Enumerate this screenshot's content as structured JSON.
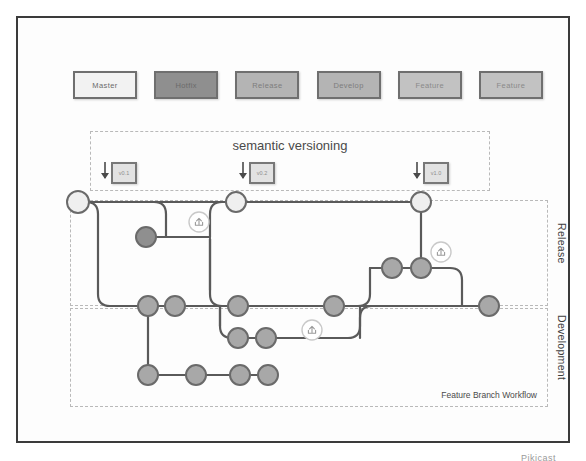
{
  "frame": {
    "watermark": "Pikicast"
  },
  "legend": {
    "items": [
      {
        "label": "Master",
        "fill": "#f2f2f2"
      },
      {
        "label": "Hotfix",
        "fill": "#8f8f8f"
      },
      {
        "label": "Release",
        "fill": "#b4b4b4"
      },
      {
        "label": "Develop",
        "fill": "#b4b4b4"
      },
      {
        "label": "Feature",
        "fill": "#c2c2c2"
      },
      {
        "label": "Feature",
        "fill": "#c2c2c2"
      }
    ]
  },
  "semver": {
    "title": "semantic versioning",
    "tags": [
      {
        "label": "v0.1"
      },
      {
        "label": "v0.2"
      },
      {
        "label": "v1.0"
      }
    ]
  },
  "lanes": {
    "release_label": "Release",
    "development_label": "Development",
    "workflow_caption": "Feature Branch Workflow"
  },
  "colors": {
    "master_node": "#efefef",
    "hotfix_node": "#8f8f8f",
    "commit_node": "#a8a8a8",
    "edge": "#5a5a5a",
    "node_stroke": "#6a6a6a",
    "merge_icon_stroke": "#c9c9c9",
    "dashed_border": "#b9b9b9",
    "frame_border": "#3b3b3b"
  },
  "graph": {
    "nodes": [
      {
        "id": "m1",
        "x": 78,
        "y": 202,
        "r": 11,
        "type": "master"
      },
      {
        "id": "m2",
        "x": 236,
        "y": 202,
        "r": 10,
        "type": "master"
      },
      {
        "id": "m3",
        "x": 421,
        "y": 202,
        "r": 10,
        "type": "master"
      },
      {
        "id": "h1",
        "x": 146,
        "y": 237,
        "r": 10,
        "type": "hotfix"
      },
      {
        "id": "r1",
        "x": 392,
        "y": 268,
        "r": 10,
        "type": "commit"
      },
      {
        "id": "r2",
        "x": 421,
        "y": 268,
        "r": 10,
        "type": "commit"
      },
      {
        "id": "d1",
        "x": 148,
        "y": 306,
        "r": 10,
        "type": "commit"
      },
      {
        "id": "d2",
        "x": 175,
        "y": 306,
        "r": 10,
        "type": "commit"
      },
      {
        "id": "d3",
        "x": 238,
        "y": 306,
        "r": 10,
        "type": "commit"
      },
      {
        "id": "d4",
        "x": 334,
        "y": 306,
        "r": 10,
        "type": "commit"
      },
      {
        "id": "d5",
        "x": 489,
        "y": 306,
        "r": 10,
        "type": "commit"
      },
      {
        "id": "f1",
        "x": 238,
        "y": 338,
        "r": 10,
        "type": "commit"
      },
      {
        "id": "f2",
        "x": 266,
        "y": 338,
        "r": 10,
        "type": "commit"
      },
      {
        "id": "g1",
        "x": 148,
        "y": 375,
        "r": 10,
        "type": "commit"
      },
      {
        "id": "g2",
        "x": 196,
        "y": 375,
        "r": 10,
        "type": "commit"
      },
      {
        "id": "g3",
        "x": 240,
        "y": 375,
        "r": 10,
        "type": "commit"
      },
      {
        "id": "g4",
        "x": 268,
        "y": 375,
        "r": 10,
        "type": "commit"
      }
    ],
    "merge_icons": [
      {
        "id": "pr1",
        "x": 199,
        "y": 222,
        "r": 10
      },
      {
        "id": "pr2",
        "x": 441,
        "y": 252,
        "r": 10
      },
      {
        "id": "pr3",
        "x": 312,
        "y": 330,
        "r": 10
      }
    ],
    "version_arrows": [
      {
        "x": 105,
        "y": 170
      },
      {
        "x": 243,
        "y": 170
      },
      {
        "x": 417,
        "y": 170
      }
    ]
  }
}
